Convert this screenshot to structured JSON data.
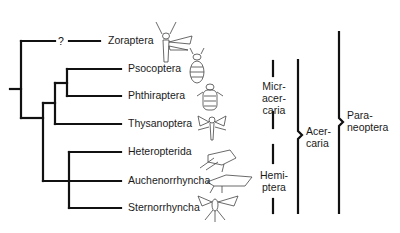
{
  "diagram": {
    "type": "cladogram",
    "taxa": [
      {
        "name": "Zoraptera",
        "y": 41,
        "uncertain_marker": "?"
      },
      {
        "name": "Psocoptera",
        "y": 69
      },
      {
        "name": "Phthiraptera",
        "y": 96
      },
      {
        "name": "Thysanoptera",
        "y": 124
      },
      {
        "name": "Heteropterida",
        "y": 152
      },
      {
        "name": "Auchenorrhyncha",
        "y": 181
      },
      {
        "name": "Sternorrhyncha",
        "y": 208
      }
    ],
    "groups": [
      {
        "id": "micracercaria",
        "lines": [
          "Micr-",
          "acer-",
          "caria"
        ]
      },
      {
        "id": "hemiptera",
        "lines": [
          "Hemi-",
          "ptera"
        ]
      },
      {
        "id": "acercaria",
        "lines": [
          "Acer-",
          "caria"
        ]
      },
      {
        "id": "paraneoptera",
        "lines": [
          "Para-",
          "neoptera"
        ]
      }
    ],
    "line_color": "#111111"
  }
}
